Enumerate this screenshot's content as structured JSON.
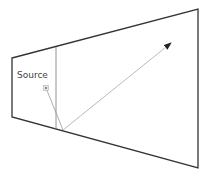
{
  "diagram": {
    "type": "ray-reflection",
    "labels": {
      "source": "Source"
    },
    "room": {
      "outline_color": "#333333",
      "corners": [
        [
          12,
          58
        ],
        [
          198,
          9
        ],
        [
          198,
          168
        ],
        [
          12,
          117
        ]
      ]
    },
    "divider": {
      "color": "#777777",
      "from": [
        56,
        47
      ],
      "to": [
        56,
        129
      ]
    },
    "source_marker": {
      "position": [
        46,
        88
      ],
      "color": "#9a9a9a"
    },
    "ray": {
      "color": "#999999",
      "incident_from": [
        46,
        88
      ],
      "reflection_point": [
        63,
        130
      ],
      "reflected_to": [
        171,
        43
      ],
      "arrowhead_color": "#222222"
    }
  }
}
